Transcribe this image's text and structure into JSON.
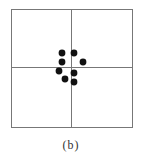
{
  "caption": "(b)",
  "diagram": {
    "frame": {
      "x": 11,
      "y": 9,
      "width": 121,
      "height": 118,
      "stroke": "#777777"
    },
    "crosshair": {
      "vx": 71,
      "hy": 67,
      "stroke": "#777777"
    },
    "dot_color": "#111111",
    "dot_radius": 3.4,
    "dots": [
      {
        "x": 62,
        "y": 53
      },
      {
        "x": 74,
        "y": 53
      },
      {
        "x": 62,
        "y": 62
      },
      {
        "x": 83,
        "y": 62
      },
      {
        "x": 59,
        "y": 71
      },
      {
        "x": 74,
        "y": 73
      },
      {
        "x": 65,
        "y": 79
      },
      {
        "x": 74,
        "y": 82
      }
    ]
  }
}
